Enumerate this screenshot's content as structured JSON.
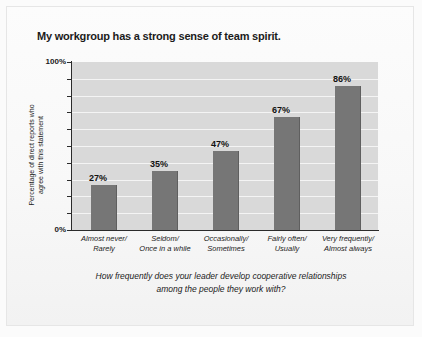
{
  "chart_data": {
    "type": "bar",
    "title": "My workgroup has a strong sense of team spirit.",
    "categories": [
      "Almost never/\nRarely",
      "Seldom/\nOnce in a while",
      "Occasionally/\nSometimes",
      "Fairly often/\nUsually",
      "Very frequently/\nAlmost always"
    ],
    "category_lines": [
      [
        "Almost never/",
        "Rarely"
      ],
      [
        "Seldom/",
        "Once in a while"
      ],
      [
        "Occasionally/",
        "Sometimes"
      ],
      [
        "Fairly often/",
        "Usually"
      ],
      [
        "Very frequently/",
        "Almost always"
      ]
    ],
    "values": [
      27,
      35,
      47,
      67,
      86
    ],
    "value_labels": [
      "27%",
      "35%",
      "47%",
      "67%",
      "86%"
    ],
    "ylabel_lines": [
      "Percentage of direct reports who",
      "agree with this statement"
    ],
    "ylabel": "Percentage of direct reports who agree with this statement",
    "xlabel_lines": [
      "How frequently does your leader develop cooperative relationships",
      "among the people they work with?"
    ],
    "xlabel": "How frequently does your leader develop cooperative relationships among the people they work with?",
    "ylim": [
      0,
      100
    ],
    "ytick_labels": [
      "100%",
      "0%"
    ],
    "ytick_values": [
      100,
      0
    ],
    "gridlines": [
      10,
      20,
      30,
      40,
      50,
      60,
      70,
      80,
      90
    ],
    "grid": true,
    "legend": "none",
    "colors": {
      "bar": "#767676",
      "plot_background": "#d9d9d9",
      "gridline": "#f4f4f4",
      "axis": "#2b2b2b",
      "text": "#1b1b1b",
      "page_background": "#fbfbfb"
    }
  }
}
